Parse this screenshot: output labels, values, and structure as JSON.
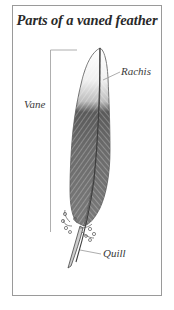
{
  "title": "Parts of a vaned feather",
  "labels": {
    "vane": "Vane",
    "rachis": "Rachis",
    "quill": "Quill"
  },
  "colors": {
    "frame_border": "#9a9a9a",
    "text": "#2a2a2a",
    "feather_dark": "#555555",
    "feather_light": "#d8d8d8",
    "leader_line": "#8a8a8a"
  }
}
